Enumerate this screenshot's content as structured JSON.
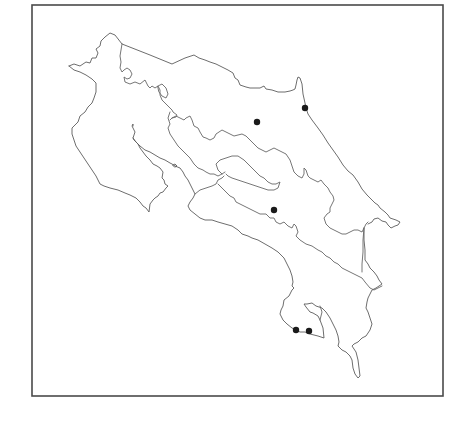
{
  "map": {
    "subject": "Costa Rica province boundaries",
    "frame": {
      "x": 32,
      "y": 5,
      "width": 411,
      "height": 391,
      "stroke": "#4a4a4a"
    },
    "line_color": "#666666",
    "marker_color": "#1a1a1a",
    "markers": [
      {
        "id": "site-1",
        "x": 257,
        "y": 122,
        "r": 3.2
      },
      {
        "id": "site-2",
        "x": 305,
        "y": 108,
        "r": 3.2
      },
      {
        "id": "site-3",
        "x": 274,
        "y": 210,
        "r": 3.2
      },
      {
        "id": "site-4",
        "x": 296,
        "y": 330,
        "r": 3.2
      },
      {
        "id": "site-5",
        "x": 309,
        "y": 331,
        "r": 3.2
      }
    ]
  }
}
